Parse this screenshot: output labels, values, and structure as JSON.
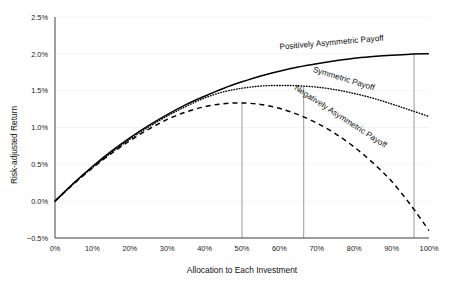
{
  "chart_data": {
    "type": "line",
    "title": "",
    "xlabel": "Allocation to Each Investment",
    "ylabel": "Risk-adjusted Return",
    "xlim": [
      0,
      100
    ],
    "ylim": [
      -0.5,
      2.5
    ],
    "xticks": [
      "0%",
      "10%",
      "20%",
      "30%",
      "40%",
      "50%",
      "60%",
      "70%",
      "80%",
      "90%",
      "100%"
    ],
    "xtick_values": [
      0,
      10,
      20,
      30,
      40,
      50,
      60,
      70,
      80,
      90,
      100
    ],
    "yticks": [
      "2.5%",
      "2.0%",
      "1.5%",
      "1.0%",
      "0.5%",
      "0.0%",
      "−0.5%"
    ],
    "ytick_values": [
      2.5,
      2.0,
      1.5,
      1.0,
      0.5,
      0.0,
      -0.5
    ],
    "grid": true,
    "legend_position": "inline-curve-labels",
    "x": [
      0,
      5,
      10,
      15,
      20,
      25,
      30,
      35,
      40,
      45,
      50,
      55,
      60,
      65,
      70,
      75,
      80,
      85,
      90,
      95,
      100
    ],
    "series": [
      {
        "name": "Positively Asymmetric Payoff",
        "style": "solid",
        "color": "#000000",
        "label_x": 74,
        "label_y": 2.12,
        "label_rotation": -5,
        "peak_x": 96,
        "peak_y": 2.0,
        "values": [
          0.0,
          0.245,
          0.47,
          0.675,
          0.86,
          1.025,
          1.175,
          1.31,
          1.425,
          1.53,
          1.62,
          1.7,
          1.765,
          1.82,
          1.865,
          1.905,
          1.94,
          1.963,
          1.982,
          1.996,
          2.0
        ]
      },
      {
        "name": "Symmetric Payoff",
        "style": "dotted",
        "color": "#000000",
        "label_x": 77,
        "label_y": 1.63,
        "label_rotation": 17,
        "peak_x": 66.5,
        "peak_y": 1.57,
        "values": [
          0.0,
          0.24,
          0.455,
          0.655,
          0.84,
          1.005,
          1.155,
          1.285,
          1.4,
          1.483,
          1.533,
          1.562,
          1.571,
          1.566,
          1.548,
          1.513,
          1.462,
          1.398,
          1.32,
          1.235,
          1.15
        ]
      },
      {
        "name": "Negatively Asymmetric Payoff",
        "style": "dashed",
        "color": "#000000",
        "label_x": 76,
        "label_y": 1.12,
        "label_rotation": 33,
        "peak_x": 50,
        "peak_y": 1.33,
        "values": [
          0.0,
          0.235,
          0.45,
          0.645,
          0.82,
          0.975,
          1.11,
          1.21,
          1.282,
          1.322,
          1.333,
          1.312,
          1.26,
          1.175,
          1.06,
          0.915,
          0.735,
          0.52,
          0.27,
          -0.045,
          -0.4
        ]
      }
    ],
    "droplines": [
      {
        "name": "dropline-50",
        "x": 50,
        "y_top": 1.33,
        "y_bottom": -0.5
      },
      {
        "name": "dropline-66",
        "x": 66.5,
        "y_top": 1.57,
        "y_bottom": -0.5
      },
      {
        "name": "dropline-96",
        "x": 96,
        "y_top": 2.0,
        "y_bottom": -0.5
      }
    ]
  }
}
